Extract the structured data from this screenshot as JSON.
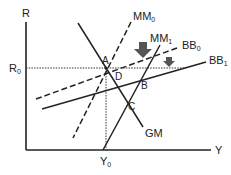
{
  "diagram": {
    "title": "",
    "axes": {
      "y_label": "R",
      "x_label": "Y",
      "y_marker": {
        "base": "R",
        "sub": "0"
      },
      "x_marker": {
        "base": "Y",
        "sub": "0"
      }
    },
    "curves": [
      {
        "id": "GM",
        "label": "GM",
        "style": "solid"
      },
      {
        "id": "MM0",
        "label_base": "MM",
        "label_sub": "0",
        "style": "dashed"
      },
      {
        "id": "MM1",
        "label_base": "MM",
        "label_sub": "1",
        "style": "solid"
      },
      {
        "id": "BB0",
        "label_base": "BB",
        "label_sub": "0",
        "style": "dashed"
      },
      {
        "id": "BB1",
        "label_base": "BB",
        "label_sub": "1",
        "style": "solid"
      }
    ],
    "points": {
      "A": "A",
      "B": "B",
      "C": "C",
      "D": "D"
    },
    "arrows": [
      {
        "id": "mm-shift",
        "direction": "down",
        "size": "large"
      },
      {
        "id": "bb-shift",
        "direction": "down",
        "size": "small"
      }
    ],
    "colors": {
      "line": "#222222",
      "arrow": "#555555",
      "background": "#ffffff"
    }
  }
}
